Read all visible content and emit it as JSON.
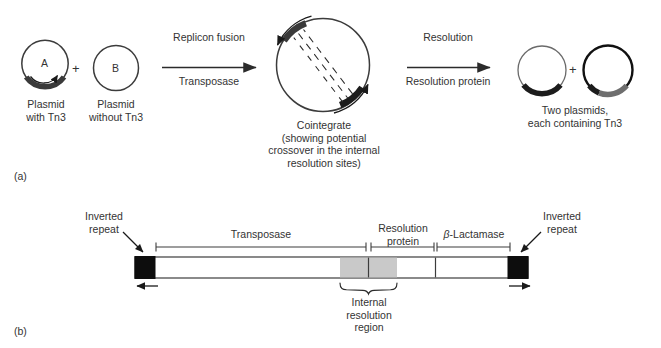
{
  "figure": {
    "panel_a_id": "(a)",
    "panel_b_id": "(b)"
  },
  "panel_a": {
    "plasmid_a_letter": "A",
    "plasmid_b_letter": "B",
    "plus_1": "+",
    "plus_2": "+",
    "label_plasmid_with": "Plasmid\nwith Tn3",
    "label_plasmid_without": "Plasmid\nwithout Tn3",
    "arrow1_above": "Replicon fusion",
    "arrow1_below": "Transposase",
    "arrow2_above": "Resolution",
    "arrow2_below": "Resolution protein",
    "label_cointegrate": "Cointegrate\n(showing potential\ncrossover in the internal\nresolution sites)",
    "label_products": "Two plasmids,\neach containing Tn3"
  },
  "panel_b": {
    "inverted_repeat_left": "Inverted\nrepeat",
    "inverted_repeat_right": "Inverted\nrepeat",
    "segment_transposase": "Transposase",
    "segment_resolution_protein": "Resolution\nprotein",
    "segment_beta_lactamase_pre": "β",
    "segment_beta_lactamase_post": "-Lactamase",
    "brace_label": "Internal\nresolution\nregion"
  },
  "colors": {
    "ink": "#2b2b2b",
    "text": "#333333",
    "black_block": "#0d0d0d",
    "dark_arc": "#3a3a3a",
    "gray_arc": "#6e6e6e",
    "gray_fill": "#c9c9c9",
    "thin_line": "#555555",
    "bar_outline": "#3c3c3c"
  }
}
